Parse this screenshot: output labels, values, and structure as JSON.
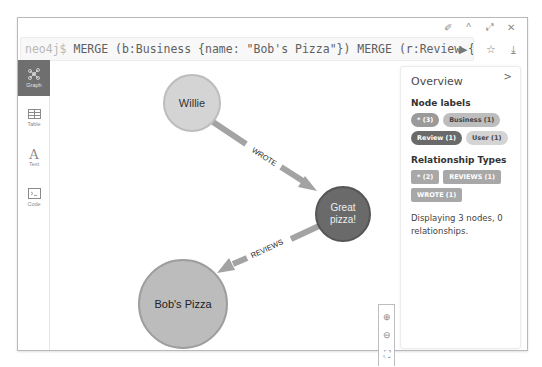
{
  "frame": {
    "controls": [
      {
        "name": "pin-icon",
        "glyph": "✐"
      },
      {
        "name": "collapse-icon",
        "glyph": "^"
      },
      {
        "name": "fullscreen-icon",
        "glyph": "⤢"
      },
      {
        "name": "close-icon",
        "glyph": "✕"
      }
    ]
  },
  "editor": {
    "prompt": "neo4j$",
    "query": " MERGE (b:Business {name: \"Bob's Pizza\"}) MERGE (r:Review {sta…",
    "run_glyph": "▶",
    "favorite_glyph": "☆",
    "download_glyph": "⤓"
  },
  "views": [
    {
      "id": "graph",
      "label": "Graph",
      "active": true
    },
    {
      "id": "table",
      "label": "Table",
      "active": false
    },
    {
      "id": "text",
      "label": "Text",
      "active": false
    },
    {
      "id": "code",
      "label": "Code",
      "active": false
    }
  ],
  "graph": {
    "nodes": [
      {
        "id": "willie",
        "label": "Willie",
        "cx": 141,
        "cy": 42,
        "r": 28,
        "fill": "#d4d4d4",
        "stroke": "#bdbdbd",
        "text_color": "#333333"
      },
      {
        "id": "review",
        "label_line1": "Great",
        "label_line2": "pizza!",
        "cx": 292,
        "cy": 153,
        "r": 27,
        "fill": "#6a6a6a",
        "stroke": "#555555",
        "text_color": "#eeeeee"
      },
      {
        "id": "bobs",
        "label": "Bob's Pizza",
        "cx": 132,
        "cy": 243,
        "r": 44,
        "fill": "#bcbcbc",
        "stroke": "#9e9e9e",
        "text_color": "#222222"
      }
    ],
    "relationships": [
      {
        "type": "WROTE",
        "label": "WROTE"
      },
      {
        "type": "REVIEWS",
        "label": "REVIEWS"
      }
    ]
  },
  "overview": {
    "title": "Overview",
    "close_glyph": ">",
    "node_labels_heading": "Node labels",
    "node_labels": [
      {
        "label": "* (3)",
        "color": "#9a9a9a",
        "text": "#ffffff"
      },
      {
        "label": "Business (1)",
        "color": "#bdbdbd",
        "text": "#444444"
      },
      {
        "label": "Review (1)",
        "color": "#6a6a6a",
        "text": "#ffffff"
      },
      {
        "label": "User (1)",
        "color": "#d4d4d4",
        "text": "#444444"
      }
    ],
    "rel_types_heading": "Relationship Types",
    "rel_types": [
      {
        "label": "* (2)",
        "color": "#a8a8a8"
      },
      {
        "label": "REVIEWS (1)",
        "color": "#a8a8a8"
      },
      {
        "label": "WROTE (1)",
        "color": "#a8a8a8"
      }
    ],
    "summary": "Displaying 3 nodes, 0 relationships."
  },
  "zoom_controls": [
    {
      "name": "zoom-in-icon",
      "glyph": "⊕"
    },
    {
      "name": "zoom-out-icon",
      "glyph": "⊖"
    },
    {
      "name": "fit-icon",
      "glyph": "⛶"
    }
  ]
}
